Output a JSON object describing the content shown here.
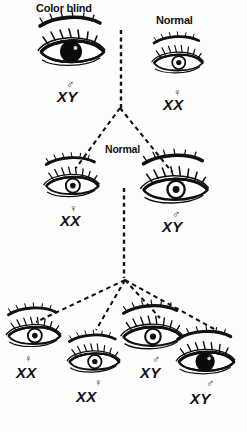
{
  "diagram": {
    "background_color": "#fdfdfc",
    "ink_color": "#121212",
    "generations": [
      {
        "name": "parents",
        "individuals": [
          {
            "id": "p1",
            "caption": "Color blind",
            "sex_symbol": "♂",
            "sex": "male",
            "genotype": "XY",
            "phenotype": "color-blind",
            "iris": "filled",
            "x": 72,
            "y": 52,
            "caption_x": 36,
            "caption_y": 2,
            "sym_x": 66,
            "sym_y": 78,
            "geno_x": 57,
            "geno_y": 88
          },
          {
            "id": "p2",
            "caption": "Normal",
            "sex_symbol": "♀",
            "sex": "female",
            "genotype": "XX",
            "phenotype": "normal",
            "iris": "open",
            "x": 178,
            "y": 63,
            "caption_x": 156,
            "caption_y": 14,
            "sym_x": 173,
            "sym_y": 86,
            "geno_x": 163,
            "geno_y": 96
          }
        ]
      },
      {
        "name": "f1",
        "caption": "Normal",
        "caption_x": 103,
        "caption_y": 143,
        "individuals": [
          {
            "id": "f1a",
            "sex_symbol": "♀",
            "sex": "female",
            "genotype": "XX",
            "phenotype": "normal-carrier",
            "iris": "open",
            "x": 72,
            "y": 186,
            "sym_x": 69,
            "sym_y": 202,
            "geno_x": 60,
            "geno_y": 212
          },
          {
            "id": "f1b",
            "sex_symbol": "♂",
            "sex": "male",
            "genotype": "XY",
            "phenotype": "normal",
            "iris": "open",
            "x": 175,
            "y": 190,
            "sym_x": 172,
            "sym_y": 208,
            "geno_x": 162,
            "geno_y": 218
          }
        ]
      },
      {
        "name": "f2",
        "individuals": [
          {
            "id": "f2a",
            "sex_symbol": "♀",
            "sex": "female",
            "genotype": "XX",
            "phenotype": "normal",
            "iris": "open",
            "x": 34,
            "y": 336,
            "sym_x": 24,
            "sym_y": 352,
            "geno_x": 16,
            "geno_y": 364
          },
          {
            "id": "f2b",
            "sex_symbol": "♀",
            "sex": "female",
            "genotype": "XX",
            "phenotype": "normal",
            "iris": "open",
            "x": 94,
            "y": 362,
            "sym_x": 94,
            "sym_y": 376,
            "geno_x": 76,
            "geno_y": 388
          },
          {
            "id": "f2c",
            "sex_symbol": "♂",
            "sex": "male",
            "genotype": "XY",
            "phenotype": "normal",
            "iris": "open",
            "x": 152,
            "y": 337,
            "sym_x": 152,
            "sym_y": 353,
            "geno_x": 140,
            "geno_y": 364
          },
          {
            "id": "f2d",
            "sex_symbol": "♂",
            "sex": "male",
            "genotype": "XY",
            "phenotype": "color-blind",
            "iris": "filled",
            "x": 206,
            "y": 362,
            "sym_x": 206,
            "sym_y": 377,
            "geno_x": 190,
            "geno_y": 390
          }
        ]
      }
    ],
    "connectors": {
      "style": "dashed",
      "mating_bars": [
        {
          "name": "parents-mating-bar",
          "x1": 121,
          "y1": 30,
          "x2": 121,
          "y2": 108
        },
        {
          "name": "f1-mating-bar",
          "x1": 124,
          "y1": 188,
          "x2": 124,
          "y2": 278
        }
      ],
      "descent_lines": [
        {
          "name": "parents-to-f1-left",
          "x1": 120,
          "y1": 108,
          "x2": 76,
          "y2": 168
        },
        {
          "name": "parents-to-f1-right",
          "x1": 120,
          "y1": 108,
          "x2": 172,
          "y2": 172
        },
        {
          "name": "f1-to-f2-1",
          "x1": 125,
          "y1": 280,
          "x2": 36,
          "y2": 322
        },
        {
          "name": "f1-to-f2-2",
          "x1": 125,
          "y1": 280,
          "x2": 96,
          "y2": 330
        },
        {
          "name": "f1-to-f2-3",
          "x1": 125,
          "y1": 280,
          "x2": 160,
          "y2": 318
        },
        {
          "name": "f1-to-f2-4",
          "x1": 125,
          "y1": 280,
          "x2": 216,
          "y2": 330
        }
      ]
    }
  }
}
